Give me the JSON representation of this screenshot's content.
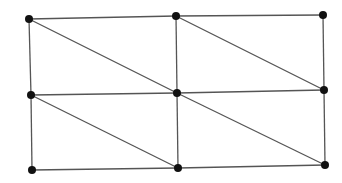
{
  "diagram": {
    "type": "triangulated-grid-graph",
    "rows": 3,
    "cols": 3,
    "nodes": [
      {
        "id": "n00",
        "row": 0,
        "col": 0
      },
      {
        "id": "n01",
        "row": 0,
        "col": 1
      },
      {
        "id": "n02",
        "row": 0,
        "col": 2
      },
      {
        "id": "n10",
        "row": 1,
        "col": 0
      },
      {
        "id": "n11",
        "row": 1,
        "col": 1
      },
      {
        "id": "n12",
        "row": 1,
        "col": 2
      },
      {
        "id": "n20",
        "row": 2,
        "col": 0
      },
      {
        "id": "n21",
        "row": 2,
        "col": 1
      },
      {
        "id": "n22",
        "row": 2,
        "col": 2
      }
    ],
    "edges": [
      {
        "from": "n00",
        "to": "n01",
        "kind": "horizontal"
      },
      {
        "from": "n01",
        "to": "n02",
        "kind": "horizontal"
      },
      {
        "from": "n10",
        "to": "n11",
        "kind": "horizontal"
      },
      {
        "from": "n11",
        "to": "n12",
        "kind": "horizontal"
      },
      {
        "from": "n20",
        "to": "n21",
        "kind": "horizontal"
      },
      {
        "from": "n21",
        "to": "n22",
        "kind": "horizontal"
      },
      {
        "from": "n00",
        "to": "n10",
        "kind": "vertical"
      },
      {
        "from": "n10",
        "to": "n20",
        "kind": "vertical"
      },
      {
        "from": "n01",
        "to": "n11",
        "kind": "vertical"
      },
      {
        "from": "n11",
        "to": "n21",
        "kind": "vertical"
      },
      {
        "from": "n02",
        "to": "n12",
        "kind": "vertical"
      },
      {
        "from": "n12",
        "to": "n22",
        "kind": "vertical"
      },
      {
        "from": "n00",
        "to": "n11",
        "kind": "diagonal"
      },
      {
        "from": "n01",
        "to": "n12",
        "kind": "diagonal"
      },
      {
        "from": "n10",
        "to": "n21",
        "kind": "diagonal"
      },
      {
        "from": "n11",
        "to": "n22",
        "kind": "diagonal"
      }
    ],
    "colors": {
      "edge": "#555555",
      "node": "#111111",
      "background": "#ffffff"
    }
  }
}
